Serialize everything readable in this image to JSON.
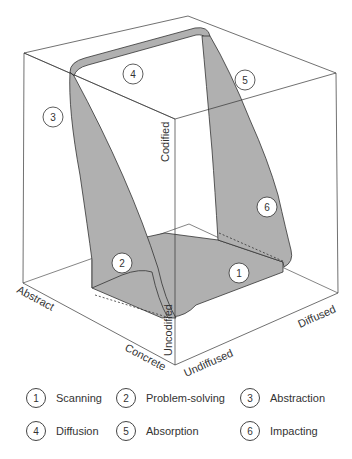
{
  "diagram": {
    "type": "3d-cube-cycle",
    "colors": {
      "shape_fill": "#b0b0b0",
      "line": "#333333",
      "background": "#ffffff"
    },
    "axes": {
      "vertical": {
        "top_label": "Codified",
        "bottom_label": "Uncodified"
      },
      "left_depth": {
        "far_label": "Abstract",
        "near_label": "Concrete"
      },
      "right_depth": {
        "near_label": "Undiffused",
        "far_label": "Diffused"
      }
    },
    "markers": [
      {
        "number": "1",
        "x": 267,
        "y": 273
      },
      {
        "number": "2",
        "x": 122,
        "y": 263
      },
      {
        "number": "3",
        "x": 53,
        "y": 117
      },
      {
        "number": "4",
        "x": 133,
        "y": 74
      },
      {
        "number": "5",
        "x": 245,
        "y": 80
      },
      {
        "number": "6",
        "x": 267,
        "y": 207
      }
    ]
  },
  "legend": [
    {
      "number": "1",
      "label": "Scanning"
    },
    {
      "number": "2",
      "label": "Problem-solving"
    },
    {
      "number": "3",
      "label": "Abstraction"
    },
    {
      "number": "4",
      "label": "Diffusion"
    },
    {
      "number": "5",
      "label": "Absorption"
    },
    {
      "number": "6",
      "label": "Impacting"
    }
  ]
}
